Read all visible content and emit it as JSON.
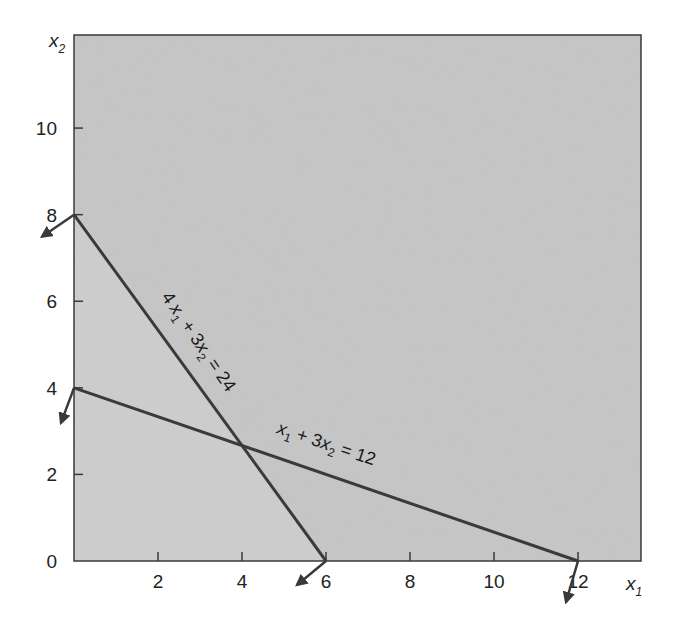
{
  "chart_data": {
    "type": "line",
    "title": "",
    "xlabel": "x1",
    "ylabel": "x2",
    "xlim": [
      0,
      13.5
    ],
    "ylim": [
      0,
      12.15
    ],
    "grid": false,
    "x_ticks": [
      2,
      4,
      6,
      8,
      10,
      12
    ],
    "y_ticks": [
      0,
      2,
      4,
      6,
      8,
      10
    ],
    "series": [
      {
        "name": "4x1 + 3x2 = 24",
        "label": {
          "base": "4",
          "v1": "x",
          "s1": "1",
          "op": " + 3",
          "v2": "x",
          "s2": "2",
          "rhs": " = 24"
        },
        "points": [
          [
            0,
            8
          ],
          [
            6,
            0
          ]
        ],
        "arrows_at": [
          [
            0,
            8
          ],
          [
            6,
            0
          ]
        ]
      },
      {
        "name": "x1 + 3x2 = 12",
        "label": {
          "base": "",
          "v1": "x",
          "s1": "1",
          "op": " + 3",
          "v2": "x",
          "s2": "2",
          "rhs": " = 12"
        },
        "points": [
          [
            0,
            4
          ],
          [
            12,
            0
          ]
        ],
        "arrows_at": [
          [
            0,
            4
          ],
          [
            12,
            0
          ]
        ]
      }
    ],
    "intersection": [
      4,
      2.667
    ],
    "shading": "entire plot area shaded gray; region below 4x1+3x2=24 slightly lighter"
  },
  "axes": {
    "x_label": {
      "var": "x",
      "sub": "1"
    },
    "y_label": {
      "var": "x",
      "sub": "2"
    },
    "x_tick_labels": [
      "2",
      "4",
      "6",
      "8",
      "10",
      "12"
    ],
    "y_tick_labels": [
      "0",
      "2",
      "4",
      "6",
      "8",
      "10"
    ]
  },
  "colors": {
    "background": "#ffffff",
    "plot_fill": "#c6c6c6",
    "plot_fill_light": "#cdcdcd",
    "line": "#3a3a3a",
    "arrow": "#3a3a3a"
  }
}
